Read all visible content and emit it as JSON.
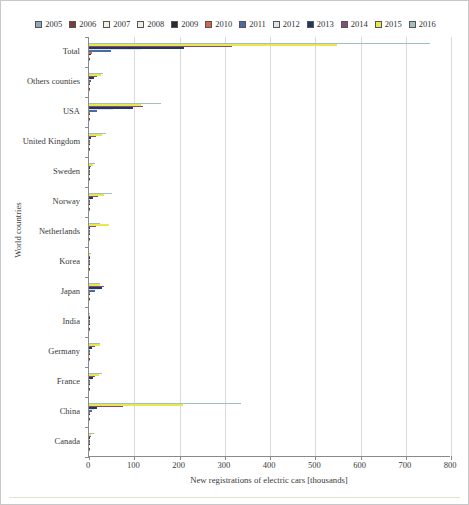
{
  "chart_data": {
    "type": "bar",
    "orientation": "horizontal",
    "title": "",
    "xlabel": "New registrations of electric cars [thousands]",
    "ylabel": "World countries",
    "xlim": [
      0,
      800
    ],
    "xticks": [
      0,
      100,
      200,
      300,
      400,
      500,
      600,
      700,
      800
    ],
    "grid": true,
    "legend_position": "top",
    "categories": [
      "Total",
      "Others counties",
      "USA",
      "United Kingdom",
      "Sweden",
      "Norway",
      "Netherlands",
      "Korea",
      "Japan",
      "India",
      "Germany",
      "France",
      "China",
      "Canada"
    ],
    "series": [
      {
        "name": "2005",
        "color": "#8ea9c1",
        "values": [
          1.2,
          0.1,
          0.6,
          0.0,
          0.0,
          0.1,
          0.0,
          0.0,
          0.4,
          0.0,
          0.0,
          0.0,
          0.0,
          0.0
        ]
      },
      {
        "name": "2006",
        "color": "#7b3b3b",
        "values": [
          1.4,
          0.1,
          0.7,
          0.0,
          0.0,
          0.1,
          0.0,
          0.0,
          0.5,
          0.0,
          0.0,
          0.0,
          0.0,
          0.0
        ]
      },
      {
        "name": "2007",
        "color": "#f2f0e3",
        "values": [
          2.0,
          0.2,
          0.9,
          0.0,
          0.0,
          0.2,
          0.0,
          0.0,
          0.7,
          0.0,
          0.0,
          0.0,
          0.0,
          0.0
        ]
      },
      {
        "name": "2008",
        "color": "#efeee6",
        "values": [
          2.5,
          0.2,
          1.1,
          0.1,
          0.0,
          0.3,
          0.0,
          0.0,
          0.8,
          0.0,
          0.0,
          0.0,
          0.0,
          0.0
        ]
      },
      {
        "name": "2009",
        "color": "#2a2a33",
        "values": [
          3.4,
          0.3,
          1.3,
          0.1,
          0.0,
          0.5,
          0.0,
          0.0,
          1.1,
          0.0,
          0.1,
          0.1,
          0.5,
          0.0
        ]
      },
      {
        "name": "2010",
        "color": "#d4674b",
        "values": [
          6.4,
          0.5,
          1.2,
          0.2,
          0.1,
          0.4,
          0.1,
          0.0,
          2.4,
          0.0,
          0.3,
          0.2,
          1.4,
          0.1
        ]
      },
      {
        "name": "2011",
        "color": "#4a6aa5",
        "values": [
          49.0,
          3.8,
          17.7,
          1.1,
          0.2,
          2.1,
          0.9,
          0.3,
          12.6,
          0.1,
          2.1,
          2.6,
          5.6,
          0.2
        ]
      },
      {
        "name": "2012",
        "color": "#dfe3ea",
        "values": [
          116.0,
          7.6,
          53.2,
          2.5,
          0.9,
          4.4,
          1.2,
          0.5,
          24.4,
          0.2,
          2.9,
          5.7,
          11.4,
          0.6
        ]
      },
      {
        "name": "2013",
        "color": "#1f3864",
        "values": [
          211.0,
          12.1,
          97.1,
          3.6,
          1.5,
          8.0,
          2.6,
          0.8,
          28.7,
          0.3,
          7.4,
          8.8,
          17.6,
          0.9
        ]
      },
      {
        "name": "2014",
        "color": "#8a4b73",
        "values": [
          315.0,
          17.5,
          118.8,
          14.6,
          4.7,
          19.8,
          15.0,
          1.1,
          33.8,
          0.4,
          13.1,
          12.5,
          74.8,
          5.0
        ]
      },
      {
        "name": "2015",
        "color": "#e8e84a",
        "values": [
          548.0,
          25.6,
          113.9,
          28.2,
          8.5,
          34.0,
          43.4,
          2.9,
          24.6,
          0.4,
          23.5,
          22.9,
          207.0,
          5.3
        ]
      },
      {
        "name": "2016",
        "color": "#9fc0bd",
        "values": [
          753.0,
          31.1,
          159.6,
          37.9,
          13.4,
          50.2,
          24.5,
          5.1,
          24.9,
          0.5,
          25.2,
          29.5,
          336.0,
          11.6
        ]
      }
    ]
  },
  "legend": {
    "items": [
      {
        "label": "2005",
        "color": "#8ea9c1"
      },
      {
        "label": "2006",
        "color": "#7b3b3b"
      },
      {
        "label": "2007",
        "color": "#f2f0e3"
      },
      {
        "label": "2008",
        "color": "#efeee6"
      },
      {
        "label": "2009",
        "color": "#2a2a33"
      },
      {
        "label": "2010",
        "color": "#d4674b"
      },
      {
        "label": "2011",
        "color": "#4a6aa5"
      },
      {
        "label": "2012",
        "color": "#dfe3ea"
      },
      {
        "label": "2013",
        "color": "#1f3864"
      },
      {
        "label": "2014",
        "color": "#8a4b73"
      },
      {
        "label": "2015",
        "color": "#e8e84a"
      },
      {
        "label": "2016",
        "color": "#9fc0bd"
      }
    ]
  }
}
